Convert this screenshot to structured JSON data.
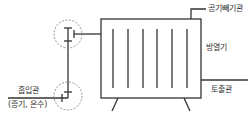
{
  "labels": {
    "air_vent": "공기빼기관",
    "radiator": "방열기",
    "discharge": "토출관",
    "inlet": "흡입관",
    "inlet_note": "(증기, 온수)"
  },
  "colors": {
    "line": "#333333",
    "dashed_circle": "#888888"
  }
}
